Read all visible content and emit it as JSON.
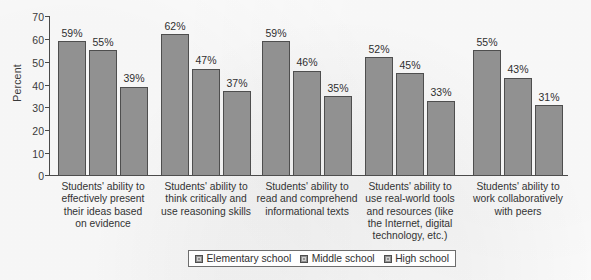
{
  "chart_data": {
    "type": "bar",
    "title": "",
    "xlabel": "",
    "ylabel": "Percent",
    "ylim": [
      0,
      70
    ],
    "yticks": [
      0,
      10,
      20,
      30,
      40,
      50,
      60,
      70
    ],
    "grid": false,
    "legend_position": "bottom",
    "value_suffix": "%",
    "categories": [
      "Students' ability to effectively present their ideas based on evidence",
      "Students' ability to think critically and use reasoning skills",
      "Students' ability to read and comprehend informational texts",
      "Students' ability to use real-world tools and resources (like the Internet, digital technology, etc.)",
      "Students' ability to work collaboratively with peers"
    ],
    "category_lines": [
      [
        "Students' ability to",
        "effectively present",
        "their ideas based",
        "on evidence"
      ],
      [
        "Students' ability to",
        "think critically and",
        "use reasoning skills"
      ],
      [
        "Students' ability to",
        "read and comprehend",
        "informational texts"
      ],
      [
        "Students' ability to",
        "use real-world tools",
        "and resources (like",
        "the Internet, digital",
        "technology, etc.)"
      ],
      [
        "Students' ability to",
        "work collaboratively",
        "with peers"
      ]
    ],
    "series": [
      {
        "name": "Elementary school",
        "color": "#919191",
        "values": [
          59,
          62,
          59,
          52,
          55
        ]
      },
      {
        "name": "Middle school",
        "color": "#919191",
        "values": [
          55,
          47,
          46,
          45,
          43
        ]
      },
      {
        "name": "High school",
        "color": "#919191",
        "values": [
          39,
          37,
          35,
          33,
          31
        ]
      }
    ],
    "value_labels": [
      [
        "59%",
        "55%",
        "39%"
      ],
      [
        "62%",
        "47%",
        "37%"
      ],
      [
        "59%",
        "46%",
        "35%"
      ],
      [
        "52%",
        "45%",
        "33%"
      ],
      [
        "55%",
        "43%",
        "31%"
      ]
    ]
  },
  "axis": {
    "ylabel": "Percent",
    "tick_0": "0",
    "tick_10": "10",
    "tick_20": "20",
    "tick_30": "30",
    "tick_40": "40",
    "tick_50": "50",
    "tick_60": "60",
    "tick_70": "70"
  },
  "legend": {
    "items": [
      {
        "label": "Elementary school"
      },
      {
        "label": "Middle school"
      },
      {
        "label": "High school"
      }
    ]
  }
}
